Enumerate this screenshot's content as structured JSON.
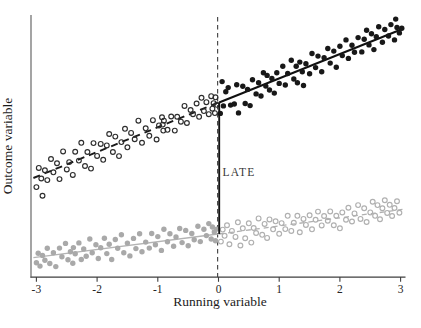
{
  "figure": {
    "background": "#ffffff"
  },
  "chart_data": {
    "type": "scatter",
    "title": "",
    "xlabel": "Running variable",
    "ylabel": "Outcome variable",
    "xlim": [
      -3.15,
      3.15
    ],
    "ylim": [
      0,
      10.4
    ],
    "grid": false,
    "legend": false,
    "x_ticks": [
      -3,
      -2,
      -1,
      0,
      1,
      2,
      3
    ],
    "x_tick_labels": [
      "-3",
      "-2",
      "-1",
      "0",
      "1",
      "2",
      "3"
    ],
    "cutoff_line": {
      "x": 0,
      "style": "dashed",
      "color": "#4d4d4d"
    },
    "late": {
      "label": "LATE",
      "x": 0,
      "y_from": 1.65,
      "y_to": 6.7,
      "color": "#141414"
    },
    "series": [
      {
        "name": "upper-left-open",
        "marker": "open-circle",
        "color": "#2e2e2e",
        "fit": {
          "x1": -3.05,
          "y1": 3.8,
          "x2": -0.01,
          "y2": 6.69,
          "style": "dashed",
          "color": "#1a1a1a",
          "width": 1.9,
          "dash": "7,5"
        },
        "points": [
          [
            -3.0,
            3.45
          ],
          [
            -2.96,
            4.19
          ],
          [
            -2.92,
            3.78
          ],
          [
            -2.9,
            3.12
          ],
          [
            -2.86,
            4.1
          ],
          [
            -2.82,
            3.72
          ],
          [
            -2.76,
            4.53
          ],
          [
            -2.72,
            4.02
          ],
          [
            -2.66,
            4.37
          ],
          [
            -2.62,
            3.76
          ],
          [
            -2.56,
            4.82
          ],
          [
            -2.5,
            4.13
          ],
          [
            -2.46,
            4.41
          ],
          [
            -2.4,
            3.92
          ],
          [
            -2.36,
            4.81
          ],
          [
            -2.3,
            4.47
          ],
          [
            -2.26,
            5.15
          ],
          [
            -2.2,
            4.26
          ],
          [
            -2.16,
            4.8
          ],
          [
            -2.1,
            4.16
          ],
          [
            -2.06,
            5.14
          ],
          [
            -2.0,
            4.65
          ],
          [
            -1.94,
            5.11
          ],
          [
            -1.9,
            4.5
          ],
          [
            -1.84,
            5.05
          ],
          [
            -1.8,
            5.49
          ],
          [
            -1.74,
            4.8
          ],
          [
            -1.7,
            5.39
          ],
          [
            -1.64,
            4.64
          ],
          [
            -1.6,
            5.18
          ],
          [
            -1.54,
            5.69
          ],
          [
            -1.5,
            4.98
          ],
          [
            -1.44,
            5.53
          ],
          [
            -1.38,
            5.29
          ],
          [
            -1.32,
            6.0
          ],
          [
            -1.26,
            5.15
          ],
          [
            -1.2,
            5.71
          ],
          [
            -1.14,
            5.42
          ],
          [
            -1.08,
            6.02
          ],
          [
            -1.02,
            5.28
          ],
          [
            -0.98,
            5.82
          ],
          [
            -0.93,
            6.13
          ],
          [
            -0.92,
            5.85
          ],
          [
            -0.91,
            5.62
          ],
          [
            -0.9,
            6.0
          ],
          [
            -0.84,
            5.65
          ],
          [
            -0.78,
            6.16
          ],
          [
            -0.72,
            5.62
          ],
          [
            -0.68,
            6.15
          ],
          [
            -0.62,
            5.96
          ],
          [
            -0.56,
            6.57
          ],
          [
            -0.52,
            5.91
          ],
          [
            -0.46,
            6.41
          ],
          [
            -0.42,
            6.25
          ],
          [
            -0.36,
            6.66
          ],
          [
            -0.32,
            6.15
          ],
          [
            -0.28,
            6.88
          ],
          [
            -0.24,
            6.37
          ],
          [
            -0.2,
            6.71
          ],
          [
            -0.16,
            6.25
          ],
          [
            -0.12,
            6.94
          ],
          [
            -0.1,
            6.46
          ],
          [
            -0.08,
            6.67
          ],
          [
            -0.06,
            6.29
          ],
          [
            -0.05,
            6.9
          ],
          [
            -0.03,
            6.61
          ]
        ]
      },
      {
        "name": "upper-right-filled",
        "marker": "filled-circle",
        "color": "#181818",
        "fit": {
          "x1": 0.01,
          "y1": 6.7,
          "x2": 3.05,
          "y2": 9.54,
          "style": "solid",
          "color": "#101010",
          "width": 2
        },
        "points": [
          [
            0.03,
            6.28
          ],
          [
            0.06,
            7.5
          ],
          [
            0.08,
            6.57
          ],
          [
            0.12,
            7.11
          ],
          [
            0.16,
            7.27
          ],
          [
            0.2,
            6.6
          ],
          [
            0.26,
            6.64
          ],
          [
            0.3,
            7.38
          ],
          [
            0.33,
            6.3
          ],
          [
            0.4,
            7.32
          ],
          [
            0.44,
            6.66
          ],
          [
            0.48,
            7.2
          ],
          [
            0.52,
            6.58
          ],
          [
            0.56,
            7.57
          ],
          [
            0.62,
            7.03
          ],
          [
            0.66,
            7.46
          ],
          [
            0.7,
            6.95
          ],
          [
            0.74,
            7.84
          ],
          [
            0.78,
            7.33
          ],
          [
            0.8,
            7.74
          ],
          [
            0.84,
            7.18
          ],
          [
            0.88,
            7.62
          ],
          [
            0.92,
            7.06
          ],
          [
            0.96,
            7.84
          ],
          [
            1.0,
            7.43
          ],
          [
            1.06,
            8.09
          ],
          [
            1.1,
            7.37
          ],
          [
            1.14,
            7.81
          ],
          [
            1.2,
            8.32
          ],
          [
            1.24,
            7.6
          ],
          [
            1.28,
            8.09
          ],
          [
            1.3,
            7.46
          ],
          [
            1.34,
            8.25
          ],
          [
            1.38,
            7.88
          ],
          [
            1.4,
            7.35
          ],
          [
            1.44,
            8.19
          ],
          [
            1.5,
            7.8
          ],
          [
            1.54,
            8.58
          ],
          [
            1.6,
            8.04
          ],
          [
            1.64,
            8.48
          ],
          [
            1.7,
            7.88
          ],
          [
            1.74,
            8.42
          ],
          [
            1.8,
            8.77
          ],
          [
            1.84,
            8.21
          ],
          [
            1.9,
            8.67
          ],
          [
            1.94,
            8.05
          ],
          [
            2.0,
            8.86
          ],
          [
            2.04,
            8.5
          ],
          [
            2.1,
            9.1
          ],
          [
            2.14,
            8.39
          ],
          [
            2.2,
            8.9
          ],
          [
            2.24,
            8.63
          ],
          [
            2.3,
            9.19
          ],
          [
            2.36,
            8.64
          ],
          [
            2.4,
            9.13
          ],
          [
            2.44,
            9.47
          ],
          [
            2.48,
            8.91
          ],
          [
            2.52,
            9.34
          ],
          [
            2.56,
            8.73
          ],
          [
            2.6,
            9.22
          ],
          [
            2.64,
            9.61
          ],
          [
            2.7,
            9.01
          ],
          [
            2.74,
            9.5
          ],
          [
            2.8,
            9.25
          ],
          [
            2.84,
            9.69
          ],
          [
            2.9,
            9.1
          ],
          [
            2.92,
            9.9
          ],
          [
            2.94,
            9.58
          ],
          [
            2.98,
            9.37
          ],
          [
            3.02,
            9.55
          ]
        ]
      },
      {
        "name": "lower-left-gray-filled",
        "marker": "filled-circle",
        "color": "#a9a9a9",
        "fit": {
          "x1": -3.05,
          "y1": 0.74,
          "x2": -0.01,
          "y2": 1.65,
          "style": "solid",
          "color": "#b4b4b4",
          "width": 1.3
        },
        "points": [
          [
            -3.0,
            0.55
          ],
          [
            -2.97,
            0.91
          ],
          [
            -2.94,
            0.42
          ],
          [
            -2.9,
            0.83
          ],
          [
            -2.86,
            0.64
          ],
          [
            -2.82,
            1.1
          ],
          [
            -2.78,
            0.52
          ],
          [
            -2.72,
            0.93
          ],
          [
            -2.68,
            0.4
          ],
          [
            -2.62,
            1.11
          ],
          [
            -2.58,
            0.78
          ],
          [
            -2.52,
            1.29
          ],
          [
            -2.48,
            0.66
          ],
          [
            -2.44,
            0.97
          ],
          [
            -2.4,
            0.53
          ],
          [
            -2.39,
            1.13
          ],
          [
            -2.36,
            0.89
          ],
          [
            -2.3,
            1.31
          ],
          [
            -2.26,
            0.67
          ],
          [
            -2.22,
            1.08
          ],
          [
            -2.18,
            0.8
          ],
          [
            -2.12,
            1.46
          ],
          [
            -2.08,
            0.93
          ],
          [
            -2.02,
            1.24
          ],
          [
            -1.98,
            0.71
          ],
          [
            -1.94,
            1.12
          ],
          [
            -1.88,
            1.49
          ],
          [
            -1.84,
            0.9
          ],
          [
            -1.8,
            1.26
          ],
          [
            -1.76,
            0.67
          ],
          [
            -1.7,
            1.44
          ],
          [
            -1.66,
            1.1
          ],
          [
            -1.6,
            1.62
          ],
          [
            -1.56,
            0.93
          ],
          [
            -1.5,
            1.3
          ],
          [
            -1.46,
            0.81
          ],
          [
            -1.4,
            1.48
          ],
          [
            -1.36,
            1.09
          ],
          [
            -1.3,
            1.66
          ],
          [
            -1.26,
            0.97
          ],
          [
            -1.2,
            1.34
          ],
          [
            -1.14,
            1.11
          ],
          [
            -1.1,
            1.67
          ],
          [
            -1.04,
            1.24
          ],
          [
            -1.0,
            1.55
          ],
          [
            -0.94,
            1.02
          ],
          [
            -0.9,
            1.83
          ],
          [
            -0.84,
            1.35
          ],
          [
            -0.8,
            1.66
          ],
          [
            -0.74,
            1.18
          ],
          [
            -0.7,
            1.54
          ],
          [
            -0.64,
            1.86
          ],
          [
            -0.6,
            1.32
          ],
          [
            -0.54,
            1.79
          ],
          [
            -0.5,
            1.2
          ],
          [
            -0.44,
            1.67
          ],
          [
            -0.4,
            1.43
          ],
          [
            -0.34,
            1.95
          ],
          [
            -0.3,
            1.36
          ],
          [
            -0.24,
            1.83
          ],
          [
            -0.2,
            1.59
          ],
          [
            -0.16,
            2.05
          ],
          [
            -0.12,
            1.46
          ],
          [
            -0.1,
            1.92
          ],
          [
            -0.07,
            1.73
          ],
          [
            -0.05,
            1.39
          ],
          [
            -0.03,
            1.84
          ]
        ]
      },
      {
        "name": "lower-right-gray-open",
        "marker": "open-circle",
        "color": "#b0b0b0",
        "fit": {
          "x1": 0.01,
          "y1": 1.65,
          "x2": 3.05,
          "y2": 2.6,
          "style": "dashed",
          "color": "#b0b0b0",
          "width": 1.3,
          "dash": "5,4"
        },
        "points": [
          [
            0.04,
            1.36
          ],
          [
            0.07,
            1.82
          ],
          [
            0.1,
            1.58
          ],
          [
            0.14,
            1.99
          ],
          [
            0.18,
            1.26
          ],
          [
            0.22,
            1.77
          ],
          [
            0.28,
            1.54
          ],
          [
            0.32,
            2.1
          ],
          [
            0.36,
            1.21
          ],
          [
            0.4,
            1.87
          ],
          [
            0.44,
            1.49
          ],
          [
            0.5,
            2.06
          ],
          [
            0.54,
            1.32
          ],
          [
            0.58,
            1.88
          ],
          [
            0.62,
            1.69
          ],
          [
            0.66,
            2.25
          ],
          [
            0.72,
            1.62
          ],
          [
            0.76,
            2.04
          ],
          [
            0.8,
            1.5
          ],
          [
            0.84,
            2.21
          ],
          [
            0.9,
            1.83
          ],
          [
            0.94,
            2.14
          ],
          [
            1.0,
            1.66
          ],
          [
            1.04,
            2.07
          ],
          [
            1.1,
            1.84
          ],
          [
            1.14,
            2.35
          ],
          [
            1.2,
            1.77
          ],
          [
            1.24,
            2.08
          ],
          [
            1.3,
            2.35
          ],
          [
            1.34,
            1.72
          ],
          [
            1.4,
            2.23
          ],
          [
            1.44,
            2.0
          ],
          [
            1.5,
            2.37
          ],
          [
            1.54,
            1.83
          ],
          [
            1.6,
            2.2
          ],
          [
            1.64,
            2.51
          ],
          [
            1.7,
            1.98
          ],
          [
            1.74,
            2.34
          ],
          [
            1.8,
            2.16
          ],
          [
            1.84,
            2.52
          ],
          [
            1.9,
            1.99
          ],
          [
            1.94,
            2.35
          ],
          [
            2.0,
            1.87
          ],
          [
            2.04,
            2.48
          ],
          [
            2.1,
            2.2
          ],
          [
            2.14,
            2.66
          ],
          [
            2.2,
            2.13
          ],
          [
            2.24,
            2.44
          ],
          [
            2.3,
            2.76
          ],
          [
            2.34,
            2.23
          ],
          [
            2.4,
            2.64
          ],
          [
            2.44,
            2.11
          ],
          [
            2.5,
            2.48
          ],
          [
            2.54,
            2.89
          ],
          [
            2.58,
            2.35
          ],
          [
            2.62,
            2.76
          ],
          [
            2.66,
            2.22
          ],
          [
            2.7,
            2.64
          ],
          [
            2.74,
            2.95
          ],
          [
            2.78,
            2.46
          ],
          [
            2.82,
            2.77
          ],
          [
            2.86,
            2.34
          ],
          [
            2.9,
            2.65
          ],
          [
            2.94,
            2.91
          ],
          [
            2.98,
            2.47
          ]
        ]
      }
    ]
  }
}
